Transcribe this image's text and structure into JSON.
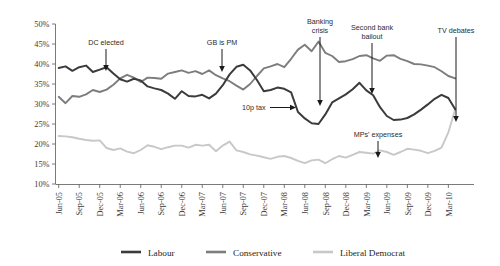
{
  "chart_data": {
    "type": "line",
    "title": "",
    "subtitle": "",
    "xlabel": "",
    "ylabel": "",
    "ylim": [
      10,
      50
    ],
    "ytick_labels": [
      "10%",
      "15%",
      "20%",
      "25%",
      "30%",
      "35%",
      "40%",
      "45%",
      "50%"
    ],
    "ytick_values": [
      10,
      15,
      20,
      25,
      30,
      35,
      40,
      45,
      50
    ],
    "grid": false,
    "legend_position": "bottom",
    "x_tick_labels": [
      "Jun-05",
      "Sep-05",
      "Dec-05",
      "Mar-06",
      "Jun-06",
      "Sep-06",
      "Dec-06",
      "Mar-07",
      "Jun-07",
      "Sep-07",
      "Dec-07",
      "Mar-08",
      "Jun-08",
      "Sep-08",
      "Dec-08",
      "Mar-09",
      "Jun-09",
      "Sep-09",
      "Dec-09",
      "Mar-10"
    ],
    "x_months": [
      "Jun-05",
      "Jul-05",
      "Aug-05",
      "Sep-05",
      "Oct-05",
      "Nov-05",
      "Dec-05",
      "Jan-06",
      "Feb-06",
      "Mar-06",
      "Apr-06",
      "May-06",
      "Jun-06",
      "Jul-06",
      "Aug-06",
      "Sep-06",
      "Oct-06",
      "Nov-06",
      "Dec-06",
      "Jan-07",
      "Feb-07",
      "Mar-07",
      "Apr-07",
      "May-07",
      "Jun-07",
      "Jul-07",
      "Aug-07",
      "Sep-07",
      "Oct-07",
      "Nov-07",
      "Dec-07",
      "Jan-08",
      "Feb-08",
      "Mar-08",
      "Apr-08",
      "May-08",
      "Jun-08",
      "Jul-08",
      "Aug-08",
      "Sep-08",
      "Oct-08",
      "Nov-08",
      "Dec-08",
      "Jan-09",
      "Feb-09",
      "Mar-09",
      "Apr-09",
      "May-09",
      "Jun-09",
      "Jul-09",
      "Aug-09",
      "Sep-09",
      "Oct-09",
      "Nov-09",
      "Dec-09",
      "Jan-10",
      "Feb-10",
      "Mar-10",
      "Apr-10"
    ],
    "series": [
      {
        "name": "Labour",
        "color": "#3b3b3b",
        "values": [
          39.0,
          39.4,
          38.3,
          39.2,
          39.6,
          38.0,
          38.6,
          39.2,
          37.6,
          36.2,
          35.6,
          36.3,
          35.9,
          34.4,
          33.9,
          33.5,
          32.6,
          31.3,
          33.2,
          32.0,
          31.9,
          32.3,
          31.4,
          32.6,
          34.7,
          37.4,
          39.3,
          39.8,
          38.4,
          36.0,
          33.2,
          33.5,
          34.1,
          33.8,
          32.9,
          28.0,
          26.4,
          25.2,
          25.0,
          27.4,
          30.4,
          31.4,
          32.4,
          33.7,
          35.3,
          33.4,
          32.2,
          29.2,
          27.0,
          26.0,
          26.1,
          26.5,
          27.4,
          28.6,
          29.9,
          31.3,
          32.3,
          31.5,
          28.7
        ]
      },
      {
        "name": "Conservative",
        "color": "#7d7d7d",
        "values": [
          31.8,
          30.2,
          32.0,
          31.8,
          32.4,
          33.5,
          33.0,
          33.6,
          34.8,
          36.4,
          37.3,
          36.6,
          35.5,
          36.6,
          36.5,
          36.3,
          37.6,
          38.0,
          38.4,
          37.8,
          38.2,
          37.5,
          38.4,
          37.2,
          36.4,
          35.7,
          34.6,
          33.6,
          35.0,
          37.0,
          38.9,
          39.4,
          40.0,
          39.2,
          41.3,
          43.6,
          44.8,
          43.2,
          45.6,
          42.8,
          42.0,
          40.5,
          40.7,
          41.2,
          42.0,
          42.2,
          41.4,
          40.8,
          42.1,
          42.2,
          41.3,
          40.7,
          40.0,
          39.9,
          39.6,
          39.2,
          38.2,
          37.0,
          36.4
        ]
      },
      {
        "name": "Liberal Democrat",
        "color": "#c8c8c8",
        "values": [
          22.0,
          21.9,
          21.7,
          21.3,
          21.0,
          20.8,
          20.9,
          19.0,
          18.5,
          18.9,
          18.1,
          17.7,
          18.5,
          19.7,
          19.3,
          18.7,
          19.2,
          19.6,
          19.6,
          19.1,
          19.8,
          19.6,
          19.8,
          18.2,
          19.6,
          20.6,
          18.4,
          18.0,
          17.4,
          17.1,
          16.7,
          16.3,
          16.8,
          17.0,
          16.5,
          15.8,
          15.2,
          15.9,
          16.1,
          15.2,
          16.2,
          17.0,
          16.6,
          17.3,
          18.0,
          17.8,
          17.6,
          18.4,
          18.0,
          17.3,
          18.0,
          18.8,
          18.6,
          18.3,
          17.7,
          18.3,
          19.1,
          22.9,
          28.7
        ]
      }
    ],
    "annotations": [
      {
        "label": "DC elected",
        "type": "down-arrow"
      },
      {
        "label": "GB is PM",
        "type": "down-arrow"
      },
      {
        "label": "10p tax",
        "type": "right-arrow"
      },
      {
        "label": "Banking crisis",
        "type": "down-arrow"
      },
      {
        "label": "Second bank bailout",
        "type": "down-arrow"
      },
      {
        "label": "MPs' expenses",
        "type": "down-arrow"
      },
      {
        "label": "TV debates",
        "type": "down-arrow"
      }
    ]
  },
  "legend": {
    "items": [
      {
        "label": "Labour",
        "color": "#3b3b3b"
      },
      {
        "label": "Conservative",
        "color": "#7d7d7d"
      },
      {
        "label": "Liberal Democrat",
        "color": "#c8c8c8"
      }
    ]
  },
  "annotation_text": {
    "dc_elected": "DC elected",
    "gb_is_pm": "GB is PM",
    "tenp_tax": "10p tax",
    "banking_crisis_line1": "Banking",
    "banking_crisis_line2": "crisis",
    "second_bailout_line1": "Second bank",
    "second_bailout_line2": "bailout",
    "mps_expenses": "MPs' expenses",
    "tv_debates": "TV debates"
  }
}
